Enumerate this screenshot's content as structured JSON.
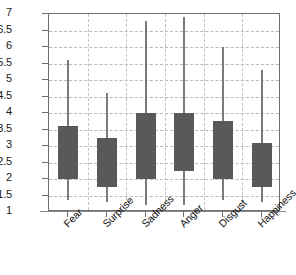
{
  "chart_data": {
    "type": "bar",
    "subtype": "floating-bar-range-with-whiskers",
    "title": "",
    "subtitle": "",
    "xlabel": "",
    "ylabel": "",
    "categories": [
      "Fear",
      "Surprise",
      "Sadness",
      "Anger",
      "Disgust",
      "Happiness"
    ],
    "ylim": [
      1,
      7
    ],
    "ytick_step": 0.5,
    "ytick_labels": [
      "7",
      "6.5",
      "6",
      "5.5",
      "5",
      "4.5",
      "4",
      "3.5",
      "3",
      "2.5",
      "2",
      "1.5",
      "1"
    ],
    "ytick_values": [
      7,
      6.5,
      6,
      5.5,
      5,
      4.5,
      4,
      3.5,
      3,
      2.5,
      2,
      1.5,
      1
    ],
    "grid": true,
    "grid_style": "dashed",
    "legend": false,
    "legend_position": "none",
    "bar_color": "#595959",
    "whisker_color": "#7a7a7a",
    "grid_color": "#b9b9b9",
    "axis_color": "#6e6e6e",
    "series": [
      {
        "name": "range",
        "box_low": [
          2.0,
          1.75,
          2.0,
          2.25,
          2.0,
          1.75
        ],
        "box_high": [
          3.6,
          3.25,
          4.0,
          4.0,
          3.75,
          3.1
        ],
        "whisker_high": [
          5.6,
          4.6,
          6.8,
          6.9,
          6.0,
          5.3
        ],
        "whisker_low": [
          1.35,
          1.3,
          1.2,
          1.2,
          1.35,
          1.3
        ]
      }
    ],
    "points": [
      {
        "category": "Fear",
        "box_low": 2.0,
        "box_high": 3.6,
        "whisker_low": 1.35,
        "whisker_high": 5.6
      },
      {
        "category": "Surprise",
        "box_low": 1.75,
        "box_high": 3.25,
        "whisker_low": 1.3,
        "whisker_high": 4.6
      },
      {
        "category": "Sadness",
        "box_low": 2.0,
        "box_high": 4.0,
        "whisker_low": 1.2,
        "whisker_high": 6.8
      },
      {
        "category": "Anger",
        "box_low": 2.25,
        "box_high": 4.0,
        "whisker_low": 1.2,
        "whisker_high": 6.9
      },
      {
        "category": "Disgust",
        "box_low": 2.0,
        "box_high": 3.75,
        "whisker_low": 1.35,
        "whisker_high": 6.0
      },
      {
        "category": "Happiness",
        "box_low": 1.75,
        "box_high": 3.1,
        "whisker_low": 1.3,
        "whisker_high": 5.3
      }
    ]
  }
}
